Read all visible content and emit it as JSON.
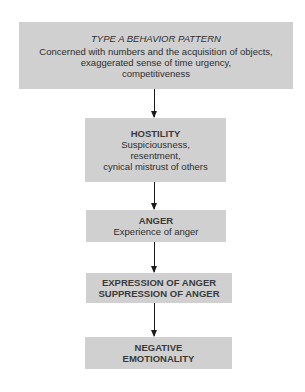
{
  "diagram": {
    "nodes": [
      {
        "id": "type-a",
        "title": "TYPE A BEHAVIOR PATTERN",
        "lines": [
          "Concerned with numbers and the acquisition of objects,",
          "exaggerated sense of time urgency,",
          "competitiveness"
        ]
      },
      {
        "id": "hostility",
        "title": "HOSTILITY",
        "lines": [
          "Suspiciousness,",
          "resentment,",
          "cynical mistrust of others"
        ]
      },
      {
        "id": "anger",
        "title": "ANGER",
        "lines": [
          "Experience of anger"
        ]
      },
      {
        "id": "expression",
        "title": "EXPRESSION OF ANGER",
        "lines": [
          "SUPPRESSION OF ANGER"
        ]
      },
      {
        "id": "negative",
        "title": "NEGATIVE",
        "lines": [
          "EMOTIONALITY"
        ]
      }
    ],
    "edges": [
      {
        "from": "type-a",
        "to": "hostility"
      },
      {
        "from": "hostility",
        "to": "anger"
      },
      {
        "from": "anger",
        "to": "expression"
      },
      {
        "from": "expression",
        "to": "negative"
      }
    ],
    "colors": {
      "box_fill": "#d0d0d0",
      "text": "#2e2e2e",
      "arrow": "#1a1a1a"
    }
  }
}
